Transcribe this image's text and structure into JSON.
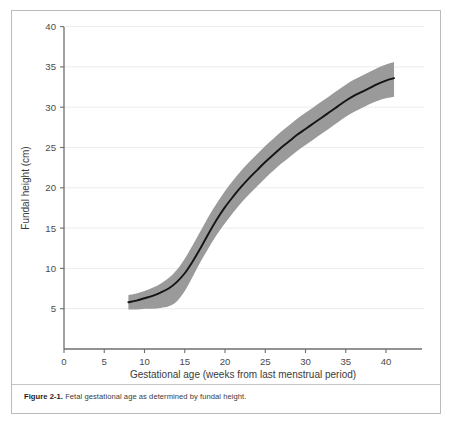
{
  "figure": {
    "caption_label": "Figure 2-1.",
    "caption_text": "Fetal gestational age as determined by fundal height."
  },
  "chart_data": {
    "type": "line",
    "title": "",
    "subtitle": "",
    "xlabel": "Gestational age (weeks from last menstrual period)",
    "ylabel": "Fundal height (cm)",
    "xlim": [
      0,
      42.5
    ],
    "ylim": [
      0,
      40
    ],
    "xticks": [
      0,
      5,
      10,
      15,
      20,
      25,
      30,
      35,
      40
    ],
    "xtick_labels": [
      "0",
      "5",
      "10",
      "15",
      "20",
      "25",
      "30",
      "35",
      "40"
    ],
    "yticks": [
      5,
      10,
      15,
      20,
      25,
      30,
      35,
      40
    ],
    "ytick_labels": [
      "5",
      "10",
      "15",
      "20",
      "25",
      "30",
      "35",
      "40"
    ],
    "grid": "horizontal",
    "legend": "none",
    "x": [
      8,
      9,
      10,
      11,
      12,
      13,
      14,
      15,
      16,
      17,
      18,
      19,
      20,
      21,
      22,
      23,
      24,
      25,
      26,
      27,
      28,
      29,
      30,
      31,
      32,
      33,
      34,
      35,
      36,
      37,
      38,
      39,
      40,
      41
    ],
    "series": [
      {
        "name": "Median fundal height",
        "color": "#141414",
        "values": [
          5.8,
          6.0,
          6.3,
          6.6,
          7.0,
          7.5,
          8.3,
          9.4,
          10.9,
          12.6,
          14.4,
          16.1,
          17.6,
          18.9,
          20.1,
          21.2,
          22.2,
          23.2,
          24.1,
          25.0,
          25.8,
          26.6,
          27.3,
          28.0,
          28.7,
          29.4,
          30.1,
          30.8,
          31.4,
          31.9,
          32.4,
          32.9,
          33.3,
          33.6
        ]
      },
      {
        "name": "Normal range upper bound",
        "color": "#9a9a9a",
        "values": [
          6.7,
          6.9,
          7.2,
          7.6,
          8.1,
          8.8,
          9.8,
          11.2,
          12.9,
          14.7,
          16.5,
          18.1,
          19.6,
          20.9,
          22.1,
          23.2,
          24.2,
          25.2,
          26.1,
          27.0,
          27.8,
          28.6,
          29.3,
          30.0,
          30.7,
          31.4,
          32.1,
          32.8,
          33.4,
          33.9,
          34.4,
          34.9,
          35.3,
          35.6
        ]
      },
      {
        "name": "Normal range lower bound",
        "color": "#9a9a9a",
        "values": [
          4.9,
          4.9,
          5.0,
          5.0,
          5.1,
          5.3,
          5.9,
          7.2,
          9.0,
          10.9,
          12.6,
          14.2,
          15.6,
          16.9,
          18.1,
          19.2,
          20.2,
          21.2,
          22.1,
          23.0,
          23.8,
          24.6,
          25.3,
          26.0,
          26.7,
          27.4,
          28.1,
          28.8,
          29.4,
          29.9,
          30.4,
          30.8,
          31.1,
          31.3
        ]
      }
    ],
    "shaded_band": {
      "name": "normal range",
      "fill": "#9a9a9a",
      "description": "shaded region between lower and upper normal bounds"
    }
  }
}
